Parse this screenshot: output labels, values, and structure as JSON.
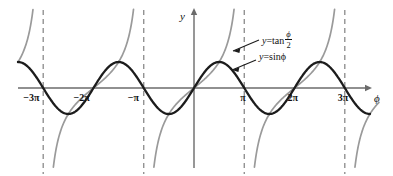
{
  "figure": {
    "kind": "math-plot",
    "background_color": "#ffffff",
    "axis_color": "#6b6b6b",
    "asymptote_color": "#8a8a8a",
    "sin_color": "#1c1c1c",
    "tan_color": "#9a9a9a"
  },
  "axes": {
    "x_axis_label": "ϕ",
    "y_axis_label": "y",
    "x_ticks": [
      {
        "label": "−3π",
        "value": -9.4248
      },
      {
        "label": "−2π",
        "value": -6.2832
      },
      {
        "label": "−π",
        "value": -3.1416
      },
      {
        "label": "π",
        "value": 3.1416
      },
      {
        "label": "2π",
        "value": 6.2832
      },
      {
        "label": "3π",
        "value": 9.4248
      }
    ],
    "asymptotes": [
      {
        "label": "−3π",
        "value": -9.4248
      },
      {
        "label": "−π",
        "value": -3.1416
      },
      {
        "label": "π",
        "value": 3.1416
      },
      {
        "label": "3π",
        "value": 9.4248
      }
    ]
  },
  "labels": {
    "tan_curve": {
      "lhs": "y",
      "eq": "=",
      "fn": "tan",
      "num": "ϕ",
      "den": "2"
    },
    "sin_curve": {
      "lhs": "y",
      "eq": "=",
      "fn": "sin",
      "arg": "ϕ"
    }
  },
  "chart_data": {
    "type": "line",
    "title": "",
    "xlabel": "ϕ",
    "ylabel": "y",
    "grid": false,
    "legend": "inline-annotations",
    "xlim": [
      -11.0,
      11.0
    ],
    "ylim": [
      -2.6,
      2.6
    ],
    "xtick_labels": [
      "−3π",
      "−2π",
      "−π",
      "π",
      "2π",
      "3π"
    ],
    "xtick_values": [
      -9.4248,
      -6.2832,
      -3.1416,
      3.1416,
      6.2832,
      9.4248
    ],
    "series": [
      {
        "name": "y = sin ϕ",
        "expression": "sin(phi)",
        "color": "#1c1c1c",
        "amplitude": 1,
        "period": 6.2832,
        "zeros": [
          -9.4248,
          -6.2832,
          -3.1416,
          0,
          3.1416,
          6.2832,
          9.4248
        ],
        "maxima_x": [
          -7.854,
          -1.5708,
          4.7124,
          10.9956
        ],
        "minima_x": [
          -10.9956,
          -4.7124,
          1.5708,
          7.854
        ],
        "max_value": 1,
        "min_value": -1
      },
      {
        "name": "y = tan ϕ/2",
        "expression": "tan(phi/2)",
        "color": "#9a9a9a",
        "period": 6.2832,
        "asymptotes_x": [
          -9.4248,
          -3.1416,
          3.1416,
          9.4248
        ],
        "zeros": [
          -6.2832,
          0,
          6.2832
        ]
      }
    ],
    "annotations": [
      {
        "text": "y = tan ϕ/2",
        "points_to_series": "y = tan ϕ/2"
      },
      {
        "text": "y = sin ϕ",
        "points_to_series": "y = sin ϕ"
      }
    ]
  }
}
